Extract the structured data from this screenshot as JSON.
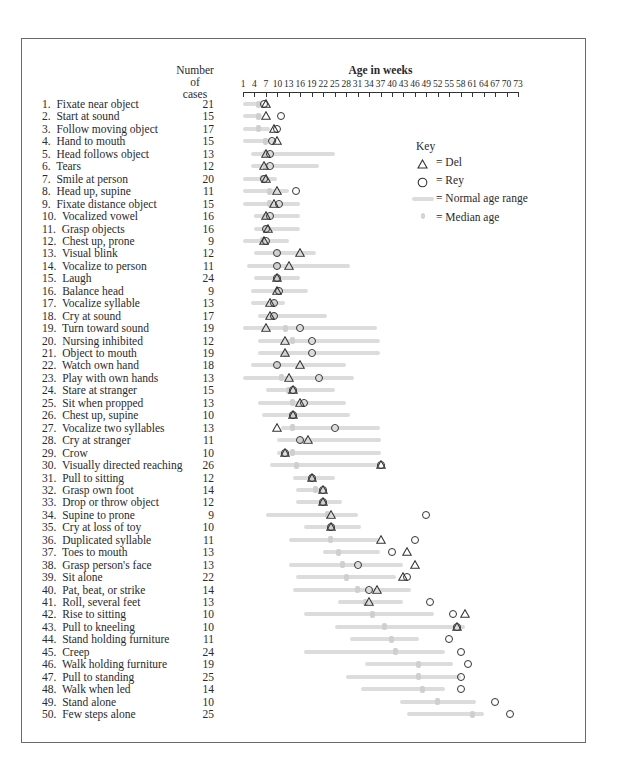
{
  "chart_data": {
    "type": "scatter",
    "title": "Age in weeks",
    "xlabel": "Age in weeks",
    "ylabel": "Number of cases",
    "xlim": [
      1,
      73
    ],
    "x_ticks": [
      1,
      4,
      7,
      10,
      13,
      16,
      19,
      22,
      25,
      28,
      31,
      34,
      37,
      40,
      43,
      46,
      49,
      52,
      55,
      58,
      61,
      64,
      67,
      70,
      73
    ],
    "column_header": [
      "Number",
      "of",
      "cases"
    ],
    "legend": {
      "title": "Key",
      "items": [
        {
          "symbol": "triangle",
          "label": "= Del"
        },
        {
          "symbol": "circle",
          "label": "= Rey"
        },
        {
          "symbol": "bar",
          "label": "= Normal age range"
        },
        {
          "symbol": "tick",
          "label": "= Median age"
        }
      ]
    },
    "rows": [
      {
        "n": 1,
        "label": "Fixate near object",
        "cases": 21,
        "range": [
          1,
          6
        ],
        "median": 5,
        "del": 7,
        "rey": 6.5
      },
      {
        "n": 2,
        "label": "Start at sound",
        "cases": 15,
        "range": [
          1,
          6
        ],
        "median": 5,
        "del": 7,
        "rey": 11
      },
      {
        "n": 3,
        "label": "Follow moving object",
        "cases": 17,
        "range": [
          1,
          8
        ],
        "median": 5,
        "del": 9,
        "rey": 10
      },
      {
        "n": 4,
        "label": "Hand to mouth",
        "cases": 15,
        "range": [
          1,
          10
        ],
        "median": 7,
        "del": 10,
        "rey": 8.5
      },
      {
        "n": 5,
        "label": "Head follows object",
        "cases": 13,
        "range": [
          3,
          25
        ],
        "median": 7,
        "del": 7,
        "rey": 8
      },
      {
        "n": 6,
        "label": "Tears",
        "cases": 12,
        "range": [
          3,
          21
        ],
        "median": 7,
        "del": 6.5,
        "rey": 8
      },
      {
        "n": 7,
        "label": "Smile at person",
        "cases": 20,
        "range": [
          1,
          10
        ],
        "median": 6,
        "del": 7,
        "rey": 6.5
      },
      {
        "n": 8,
        "label": "Head up, supine",
        "cases": 11,
        "range": [
          1,
          13
        ],
        "median": 8,
        "del": 10,
        "rey": 15
      },
      {
        "n": 9,
        "label": "Fixate distance object",
        "cases": 15,
        "range": [
          1,
          16
        ],
        "median": 8,
        "del": 9,
        "rey": 10.5
      },
      {
        "n": 10,
        "label": "Vocalized vowel",
        "cases": 16,
        "range": [
          4,
          16
        ],
        "median": 7,
        "del": 7,
        "rey": 8
      },
      {
        "n": 11,
        "label": "Grasp objects",
        "cases": 16,
        "range": [
          4,
          16
        ],
        "median": 7,
        "del": 7.5,
        "rey": 7
      },
      {
        "n": 12,
        "label": "Chest up, prone",
        "cases": 9,
        "range": [
          1,
          13
        ],
        "median": 6,
        "del": 6.5,
        "rey": 7
      },
      {
        "n": 13,
        "label": "Visual blink",
        "cases": 12,
        "range": [
          4,
          20
        ],
        "median": 10,
        "del": 16,
        "rey": 10
      },
      {
        "n": 14,
        "label": "Vocalize to person",
        "cases": 11,
        "range": [
          2,
          29
        ],
        "median": 10,
        "del": 13,
        "rey": 10
      },
      {
        "n": 15,
        "label": "Laugh",
        "cases": 24,
        "range": [
          4,
          16
        ],
        "median": 10,
        "del": 10,
        "rey": 10
      },
      {
        "n": 16,
        "label": "Balance head",
        "cases": 9,
        "range": [
          3,
          18
        ],
        "median": 10,
        "del": 10,
        "rey": 10.5
      },
      {
        "n": 17,
        "label": "Vocalize syllable",
        "cases": 13,
        "range": [
          3,
          12
        ],
        "median": 9,
        "del": 8,
        "rey": 9
      },
      {
        "n": 18,
        "label": "Cry at sound",
        "cases": 17,
        "range": [
          5,
          23
        ],
        "median": 9,
        "del": 8,
        "rey": 9
      },
      {
        "n": 19,
        "label": "Turn toward sound",
        "cases": 19,
        "range": [
          1,
          36
        ],
        "median": 12,
        "del": 7,
        "rey": 16
      },
      {
        "n": 20,
        "label": "Nursing inhibited",
        "cases": 12,
        "range": [
          5,
          37
        ],
        "median": 14,
        "del": 12,
        "rey": 19
      },
      {
        "n": 21,
        "label": "Object to mouth",
        "cases": 19,
        "range": [
          5,
          37
        ],
        "median": 12,
        "del": 12,
        "rey": 19
      },
      {
        "n": 22,
        "label": "Watch own hand",
        "cases": 18,
        "range": [
          3,
          28
        ],
        "median": 10,
        "del": 16,
        "rey": 10
      },
      {
        "n": 23,
        "label": "Play with own hands",
        "cases": 13,
        "range": [
          1,
          30
        ],
        "median": 11,
        "del": 13,
        "rey": 21
      },
      {
        "n": 24,
        "label": "Stare at stranger",
        "cases": 15,
        "range": [
          7,
          25
        ],
        "median": 13,
        "del": 14,
        "rey": 14
      },
      {
        "n": 25,
        "label": "Sit when propped",
        "cases": 13,
        "range": [
          5,
          28
        ],
        "median": 14,
        "del": 16,
        "rey": 17
      },
      {
        "n": 26,
        "label": "Chest up, supine",
        "cases": 10,
        "range": [
          6,
          29
        ],
        "median": 14,
        "del": 14,
        "rey": 14
      },
      {
        "n": 27,
        "label": "Vocalize two syllables",
        "cases": 13,
        "range": [
          11,
          37
        ],
        "median": 14,
        "del": 10,
        "rey": 25
      },
      {
        "n": 28,
        "label": "Cry at stranger",
        "cases": 11,
        "range": [
          10,
          37
        ],
        "median": 16,
        "del": 18,
        "rey": 16
      },
      {
        "n": 29,
        "label": "Crow",
        "cases": 10,
        "range": [
          10,
          37
        ],
        "median": 14,
        "del": 12,
        "rey": 12
      },
      {
        "n": 30,
        "label": "Visually directed reaching",
        "cases": 26,
        "range": [
          8,
          37
        ],
        "median": 15,
        "del": 37,
        "rey": 37
      },
      {
        "n": 31,
        "label": "Pull to sitting",
        "cases": 12,
        "range": [
          14,
          25
        ],
        "median": 19,
        "del": 19,
        "rey": 19
      },
      {
        "n": 32,
        "label": "Grasp own foot",
        "cases": 14,
        "range": [
          15,
          23
        ],
        "median": 20,
        "del": 22,
        "rey": 22
      },
      {
        "n": 33,
        "label": "Drop or throw object",
        "cases": 12,
        "range": [
          15,
          27
        ],
        "median": 22,
        "del": 22,
        "rey": 22
      },
      {
        "n": 34,
        "label": "Supine to prone",
        "cases": 9,
        "range": [
          7,
          31
        ],
        "median": 23,
        "del": 24,
        "rey": 49
      },
      {
        "n": 35,
        "label": "Cry at loss of toy",
        "cases": 10,
        "range": [
          17,
          32
        ],
        "median": 24,
        "del": 24,
        "rey": 24
      },
      {
        "n": 36,
        "label": "Duplicated syllable",
        "cases": 11,
        "range": [
          13,
          37
        ],
        "median": 24,
        "del": 37,
        "rey": 46
      },
      {
        "n": 37,
        "label": "Toes to mouth",
        "cases": 13,
        "range": [
          22,
          37
        ],
        "median": 26,
        "del": 44,
        "rey": 40
      },
      {
        "n": 38,
        "label": "Grasp person's face",
        "cases": 13,
        "range": [
          13,
          43
        ],
        "median": 27,
        "del": 46,
        "rey": 31
      },
      {
        "n": 39,
        "label": "Sit alone",
        "cases": 22,
        "range": [
          15,
          41
        ],
        "median": 28,
        "del": 43,
        "rey": 44
      },
      {
        "n": 40,
        "label": "Pat, beat, or strike",
        "cases": 14,
        "range": [
          14,
          45
        ],
        "median": 31,
        "del": 36,
        "rey": 34
      },
      {
        "n": 41,
        "label": "Roll, several feet",
        "cases": 13,
        "range": [
          26,
          43
        ],
        "median": 33,
        "del": 34,
        "rey": 50
      },
      {
        "n": 42,
        "label": "Rise to sitting",
        "cases": 10,
        "range": [
          17,
          51
        ],
        "median": 35,
        "del": 59,
        "rey": 56
      },
      {
        "n": 43,
        "label": "Pull to kneeling",
        "cases": 10,
        "range": [
          25,
          59
        ],
        "median": 38,
        "del": 57,
        "rey": 57
      },
      {
        "n": 44,
        "label": "Stand holding furniture",
        "cases": 11,
        "range": [
          29,
          47
        ],
        "median": 40,
        "del": null,
        "rey": 55
      },
      {
        "n": 45,
        "label": "Creep",
        "cases": 24,
        "range": [
          17,
          54
        ],
        "median": 41,
        "del": null,
        "rey": 58
      },
      {
        "n": 46,
        "label": "Walk holding furniture",
        "cases": 19,
        "range": [
          33,
          56
        ],
        "median": 47,
        "del": null,
        "rey": 60
      },
      {
        "n": 47,
        "label": "Pull to standing",
        "cases": 25,
        "range": [
          28,
          58
        ],
        "median": 47,
        "del": null,
        "rey": 58
      },
      {
        "n": 48,
        "label": "Walk when led",
        "cases": 14,
        "range": [
          32,
          54
        ],
        "median": 48,
        "del": null,
        "rey": 58
      },
      {
        "n": 49,
        "label": "Stand alone",
        "cases": 10,
        "range": [
          42,
          62
        ],
        "median": 52,
        "del": null,
        "rey": 67
      },
      {
        "n": 50,
        "label": "Few steps alone",
        "cases": 25,
        "range": [
          44,
          64
        ],
        "median": 61,
        "del": null,
        "rey": 71
      }
    ]
  }
}
